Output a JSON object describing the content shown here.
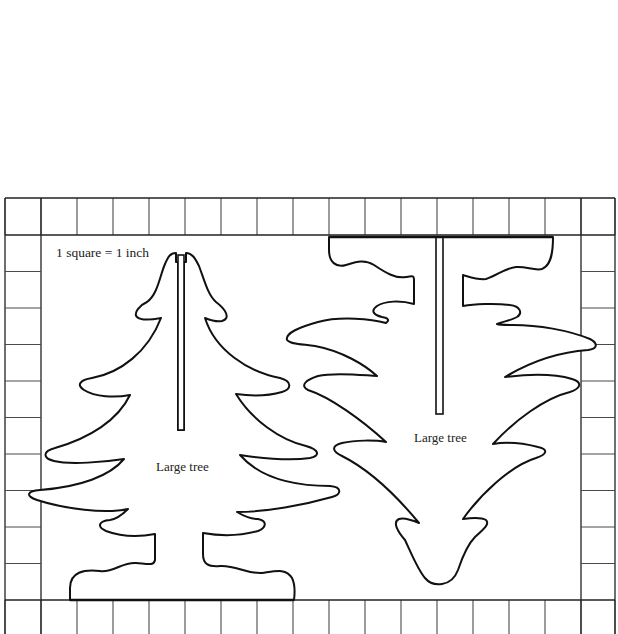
{
  "diagram": {
    "type": "pattern-template",
    "scale_note": "1 square = 1 inch",
    "grid": {
      "columns": 17,
      "rows": 12,
      "cell_size_px": 36.3,
      "left": 5,
      "top": 198,
      "right": 615,
      "bottom": 634,
      "inner_left": 41,
      "inner_top": 235,
      "inner_right": 581,
      "inner_bottom": 600
    },
    "pieces": [
      {
        "id": "left-piece",
        "label": "Large tree",
        "orientation": "upright",
        "slot": "from top down to center"
      },
      {
        "id": "right-piece",
        "label": "Large tree",
        "orientation": "inverted",
        "slot": "from base down to center"
      }
    ],
    "colors": {
      "background": "#ffffff",
      "line": "#111111",
      "grid": "#4a4a4a"
    }
  }
}
